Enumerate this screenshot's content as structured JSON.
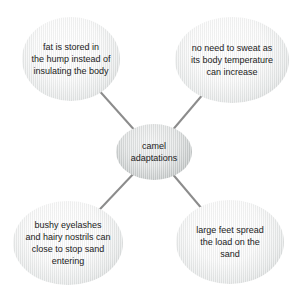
{
  "diagram": {
    "type": "concept-map",
    "center_node": {
      "label": "camel\nadaptations"
    },
    "nodes": {
      "top_left": {
        "label": "fat is stored in\nthe hump instead of\ninsulating the body"
      },
      "top_right": {
        "label": "no need to sweat as\nits body temperature\ncan increase"
      },
      "bottom_left": {
        "label": "bushy eyelashes\nand hairy nostrils can\nclose to stop sand\nentering"
      },
      "bottom_right": {
        "label": "large feet spread\nthe load on the\nsand"
      }
    },
    "connectors": [
      {
        "from": "center",
        "to": "top_left"
      },
      {
        "from": "center",
        "to": "top_right"
      },
      {
        "from": "center",
        "to": "bottom_left"
      },
      {
        "from": "center",
        "to": "bottom_right"
      }
    ],
    "colors": {
      "background": "#ffffff",
      "connector_line": "#8c8c8c",
      "node_edge_gray": "#c2c6c6",
      "center_node_edge_gray": "#aeb2b4",
      "text": "#222222"
    }
  }
}
